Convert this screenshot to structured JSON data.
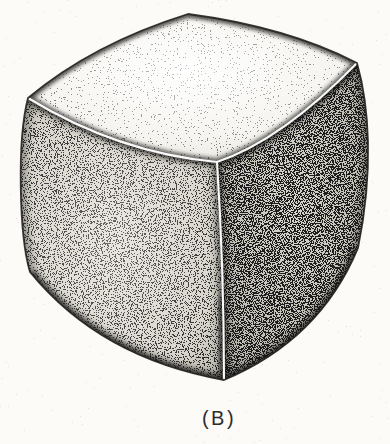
{
  "figure": {
    "panel_label": "(B)",
    "ink_color": "#1b1a18",
    "paper_color": "#fcfbf8",
    "edge_highlight_color": "#ffffff"
  }
}
